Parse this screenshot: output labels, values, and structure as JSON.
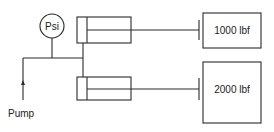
{
  "diagram": {
    "type": "hydraulic-circuit",
    "gauge": {
      "label": "Psi",
      "icon": "pressure-gauge-icon"
    },
    "source": {
      "label": "Pump",
      "icon": "flow-arrow-icon"
    },
    "cylinders": [
      {
        "id": "top",
        "icon": "hydraulic-cylinder-icon"
      },
      {
        "id": "bottom",
        "icon": "hydraulic-cylinder-icon"
      }
    ],
    "loads": [
      {
        "label": "1000 lbf"
      },
      {
        "label": "2000 lbf"
      }
    ],
    "colors": {
      "line": "#2a2a2a",
      "text": "#1a1a1a",
      "background": "#ffffff"
    }
  }
}
